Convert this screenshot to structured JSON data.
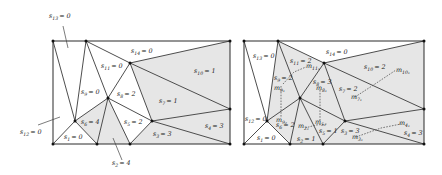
{
  "colors": {
    "shaded_face": "#e6e6e6",
    "white_face": "#ffffff",
    "edge": "#3a3a3a",
    "vertex": "#111111"
  },
  "left_diagram": {
    "labels": {
      "s1": {
        "var": "s",
        "sub": "1",
        "value": "= 0"
      },
      "s2": {
        "var": "s",
        "sub": "2",
        "value": "= 4"
      },
      "s3": {
        "var": "s",
        "sub": "3",
        "value": "= 3"
      },
      "s4": {
        "var": "s",
        "sub": "4",
        "value": "= 3"
      },
      "s5": {
        "var": "s",
        "sub": "5",
        "value": "= 2"
      },
      "s6": {
        "var": "s",
        "sub": "6",
        "value": "= 4"
      },
      "s7": {
        "var": "s",
        "sub": "7",
        "value": "= 1"
      },
      "s8": {
        "var": "s",
        "sub": "8",
        "value": "= 2"
      },
      "s9": {
        "var": "s",
        "sub": "9",
        "value": "= 0"
      },
      "s10": {
        "var": "s",
        "sub": "10",
        "value": "= 1"
      },
      "s11": {
        "var": "s",
        "sub": "11",
        "value": "= 0"
      },
      "s12": {
        "var": "s",
        "sub": "12",
        "value": "= 0"
      },
      "s13": {
        "var": "s",
        "sub": "13",
        "value": "= 0"
      },
      "s14": {
        "var": "s",
        "sub": "14",
        "value": "= 0"
      }
    }
  },
  "right_diagram": {
    "labels": {
      "s1": {
        "var": "s",
        "sub": "1",
        "value": "= 0"
      },
      "s2": {
        "var": "s",
        "sub": "2",
        "value": "= 1"
      },
      "s3": {
        "var": "s",
        "sub": "3",
        "value": "= 3"
      },
      "s4": {
        "var": "s",
        "sub": "4",
        "value": "= 3"
      },
      "s5": {
        "var": "s",
        "sub": "5",
        "value": "= 1"
      },
      "s6": {
        "var": "s",
        "sub": "6",
        "value": "= 2"
      },
      "s7": {
        "var": "s",
        "sub": "7",
        "value": "= 2"
      },
      "s8": {
        "var": "s",
        "sub": "8",
        "value": "= 3"
      },
      "s9": {
        "var": "s",
        "sub": "9",
        "value": "= 2"
      },
      "s10": {
        "var": "s",
        "sub": "10",
        "value": "= 2"
      },
      "s11": {
        "var": "s",
        "sub": "11",
        "value": "= 2"
      },
      "s12": {
        "var": "s",
        "sub": "12",
        "value": "= 0"
      },
      "s13": {
        "var": "s",
        "sub": "13",
        "value": "= 0"
      },
      "s14": {
        "var": "s",
        "sub": "14",
        "value": "= 0"
      }
    },
    "move_labels": {
      "m11": {
        "var": "m",
        "sub": "11₁"
      },
      "m9": {
        "var": "m",
        "sub": "9₁"
      },
      "m9b": {
        "var": "m",
        "sub": "9₂"
      },
      "m8": {
        "var": "m",
        "sub": "8₁"
      },
      "m5": {
        "var": "m",
        "sub": "5₁"
      },
      "m2": {
        "var": "m",
        "sub": "2₁"
      },
      "m7": {
        "var": "m",
        "sub": "7₁"
      },
      "m10": {
        "var": "m",
        "sub": "10₁"
      },
      "m3": {
        "var": "m",
        "sub": "3₁"
      },
      "m4": {
        "var": "m",
        "sub": "4₁"
      }
    }
  }
}
